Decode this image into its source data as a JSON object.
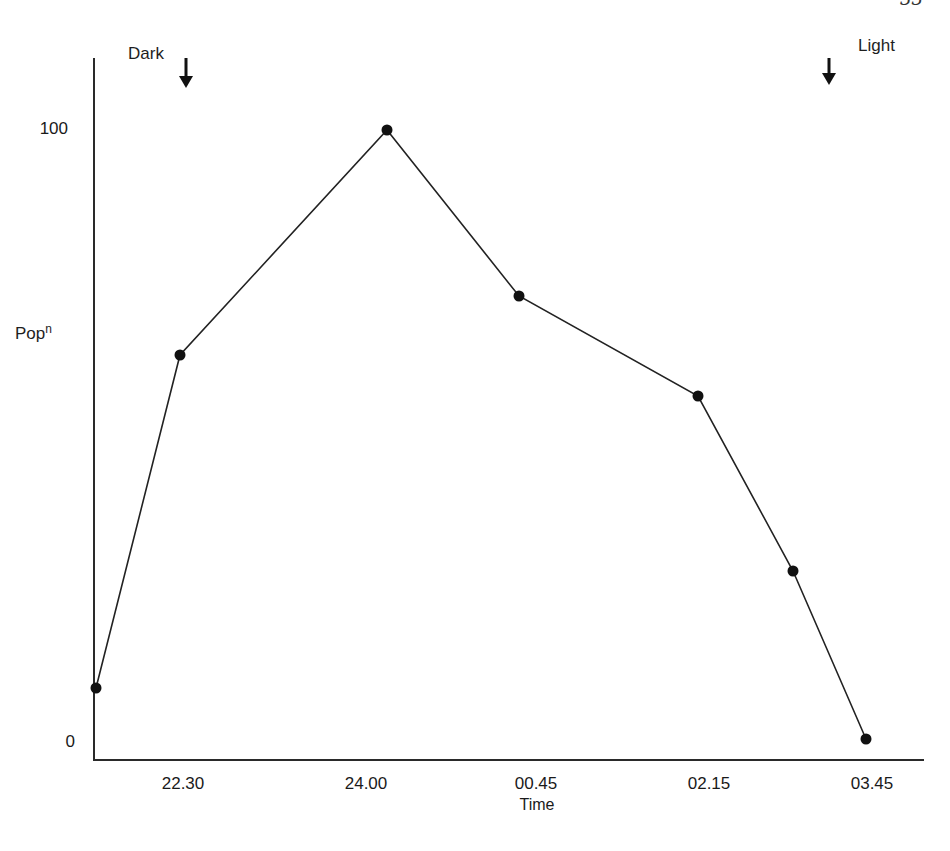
{
  "page": {
    "page_number_partial": "33"
  },
  "chart_data": {
    "type": "line",
    "title": "",
    "xlabel": "Time",
    "ylabel": "Popn",
    "ylabel_base": "Pop",
    "ylabel_sup": "n",
    "x_tick_labels": [
      "22.30",
      "24.00",
      "00.45",
      "02.15",
      "03.45"
    ],
    "y_tick_labels": [
      "0",
      "100"
    ],
    "ylim": [
      0,
      100
    ],
    "grid": false,
    "legend": null,
    "annotations": [
      {
        "text": "Dark",
        "marker": "down-arrow",
        "x_time": "22.30"
      },
      {
        "text": "Light",
        "marker": "down-arrow",
        "x_time": "~03.15"
      }
    ],
    "series": [
      {
        "name": "Population",
        "x": [
          "~21.45",
          "22.30",
          "24.00",
          "00.45",
          "02.15",
          "~03.00",
          "03.45"
        ],
        "values": [
          9,
          63,
          100,
          73,
          56,
          28,
          0
        ]
      }
    ]
  },
  "geometry": {
    "points_px": [
      [
        96,
        688
      ],
      [
        180,
        355
      ],
      [
        387,
        130
      ],
      [
        519,
        296
      ],
      [
        698,
        396
      ],
      [
        793,
        571
      ],
      [
        866,
        739
      ]
    ]
  }
}
